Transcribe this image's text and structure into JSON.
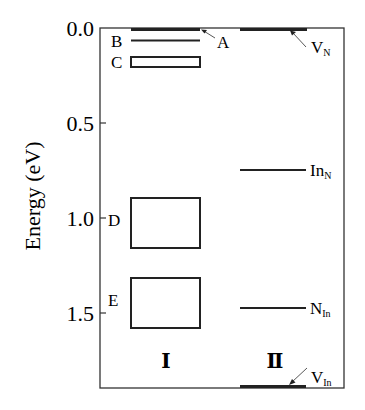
{
  "figure": {
    "y_axis": {
      "title": "Energy (eV)",
      "ticks": [
        {
          "value": 0.0,
          "label": "0.0"
        },
        {
          "value": 0.5,
          "label": "0.5"
        },
        {
          "value": 1.0,
          "label": "1.0"
        },
        {
          "value": 1.5,
          "label": "1.5"
        }
      ],
      "range": [
        0.0,
        1.9
      ],
      "inverted": true
    },
    "columns": [
      {
        "id": "I",
        "label": "Ⅰ"
      },
      {
        "id": "II",
        "label": "Ⅱ"
      }
    ],
    "levels_I": [
      {
        "name": "A",
        "type": "line",
        "energy": 0.0,
        "thick": true,
        "label_side": "right-arrow"
      },
      {
        "name": "B",
        "type": "line",
        "energy": 0.06,
        "label_side": "left"
      },
      {
        "name": "C",
        "type": "band",
        "from": 0.15,
        "to": 0.21,
        "label_side": "left"
      },
      {
        "name": "D",
        "type": "band",
        "from": 0.89,
        "to": 1.16,
        "label_side": "left"
      },
      {
        "name": "E",
        "type": "band",
        "from": 1.32,
        "to": 1.58,
        "label_side": "left"
      }
    ],
    "levels_II": [
      {
        "name": "V",
        "sub": "N",
        "type": "line",
        "energy": 0.0,
        "thick": true,
        "label_side": "right-arrow"
      },
      {
        "name": "In",
        "sub": "N",
        "type": "line",
        "energy": 0.75,
        "label_side": "right"
      },
      {
        "name": "N",
        "sub": "In",
        "type": "line",
        "energy": 1.47,
        "label_side": "right"
      },
      {
        "name": "V",
        "sub": "In",
        "type": "line",
        "energy": 1.89,
        "thick": true,
        "label_side": "right-arrow"
      }
    ]
  }
}
